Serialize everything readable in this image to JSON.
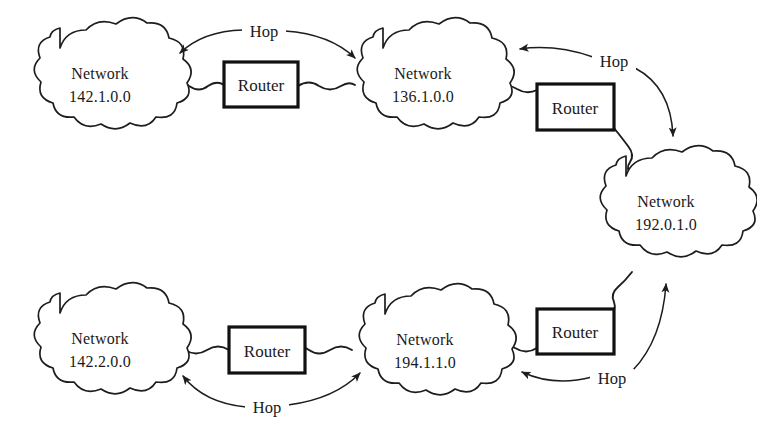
{
  "diagram": {
    "background_color": "#ffffff",
    "line_color": "#1d1d1d",
    "text_color": "#1a1a1a",
    "networks": [
      {
        "id": "net-142-1",
        "name": "Network",
        "address": "142.1.0.0",
        "cx": 100,
        "cy": 84
      },
      {
        "id": "net-136-1",
        "name": "Network",
        "address": "136.1.0.0",
        "cx": 423,
        "cy": 84
      },
      {
        "id": "net-192-0",
        "name": "Network",
        "address": "192.0.1.0",
        "cx": 666,
        "cy": 212
      },
      {
        "id": "net-142-2",
        "name": "Network",
        "address": "142.2.0.0",
        "cx": 100,
        "cy": 349
      },
      {
        "id": "net-194-1",
        "name": "Network",
        "address": "194.1.1.0",
        "cx": 425,
        "cy": 350
      }
    ],
    "routers": [
      {
        "id": "router-top-left",
        "label": "Router",
        "x": 224,
        "y": 62,
        "w": 74,
        "h": 45
      },
      {
        "id": "router-top-right",
        "label": "Router",
        "x": 537,
        "y": 84,
        "w": 77,
        "h": 46
      },
      {
        "id": "router-bottom-left",
        "label": "Router",
        "x": 229,
        "y": 327,
        "w": 76,
        "h": 46
      },
      {
        "id": "router-bottom-right",
        "label": "Router",
        "x": 537,
        "y": 309,
        "w": 77,
        "h": 45
      }
    ],
    "hops": [
      {
        "id": "hop-top-left",
        "label": "Hop",
        "x": 263,
        "y": 35
      },
      {
        "id": "hop-top-right",
        "label": "Hop",
        "x": 614,
        "y": 65
      },
      {
        "id": "hop-bottom-left",
        "label": "Hop",
        "x": 266,
        "y": 412
      },
      {
        "id": "hop-bottom-right",
        "label": "Hop",
        "x": 612,
        "y": 382
      }
    ]
  }
}
